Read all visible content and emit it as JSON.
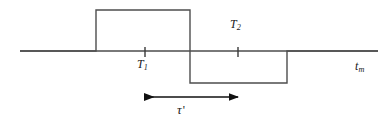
{
  "figure": {
    "type": "waveform-timing-diagram",
    "background_color": "#ffffff",
    "stroke_color": "#4d4d4d",
    "text_color": "#1a1a1a",
    "axis": {
      "label": "t",
      "label_subscript": "m",
      "label_full": "tm",
      "x_start": 20,
      "x_end": 378,
      "y": 51
    },
    "ticks": [
      {
        "name": "T1",
        "label": "T",
        "subscript": "1",
        "x": 145,
        "label_position": "below-axis"
      },
      {
        "name": "T2",
        "label": "T",
        "subscript": "2",
        "x": 238,
        "label_position": "above-axis"
      }
    ],
    "waveform": {
      "baseline_y": 51,
      "high_y": 10,
      "low_y": 83,
      "rise_x": 96,
      "transition_x": 190,
      "return_x": 287,
      "segments": [
        {
          "level": "zero",
          "from_x": 20,
          "to_x": 96
        },
        {
          "level": "high",
          "from_x": 96,
          "to_x": 190
        },
        {
          "level": "low",
          "from_x": 190,
          "to_x": 287
        },
        {
          "level": "zero",
          "from_x": 287,
          "to_x": 378
        }
      ]
    },
    "interval": {
      "label": "τ",
      "prime": "'",
      "label_full": "τ'",
      "arrow_y": 97,
      "arrow_x_start": 145,
      "arrow_x_end": 238,
      "double_headed": true
    }
  }
}
